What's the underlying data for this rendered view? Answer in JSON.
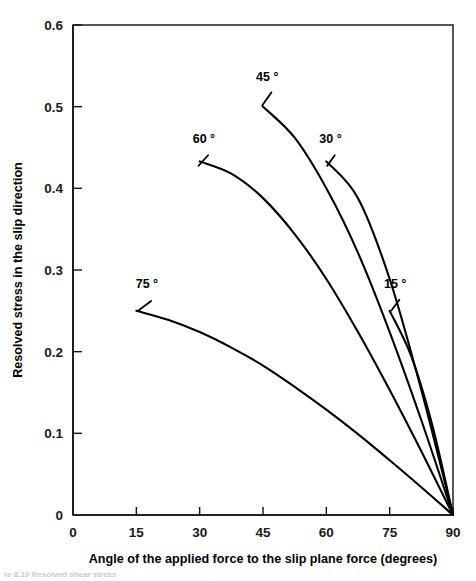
{
  "figure": {
    "name": "resolved-stress-vs-angle-plot",
    "caption_partial": "re 8.10  Resolved shear stress"
  },
  "chart_data": {
    "type": "line",
    "title": "",
    "xlabel": "Angle of the applied force to the slip plane force (degrees)",
    "ylabel": "Resolved stress in the slip direction",
    "xlim": [
      0,
      90
    ],
    "ylim": [
      0,
      0.6
    ],
    "xticks": [
      0,
      15,
      30,
      45,
      60,
      75,
      90
    ],
    "xticklabels": [
      "0",
      "15",
      "30",
      "45",
      "60",
      "75",
      "90"
    ],
    "yticks": [
      0,
      0.1,
      0.2,
      0.3,
      0.4,
      0.5,
      0.6
    ],
    "yticklabels": [
      "0",
      "0.1",
      "0.2",
      "0.3",
      "0.4",
      "0.5",
      "0.6"
    ],
    "grid": false,
    "legend": "inline-curve-labels",
    "series": [
      {
        "name": "75 °",
        "label": "75 °",
        "label_x": 17.5,
        "label_y": 0.278,
        "leader": [
          [
            18.5,
            0.262
          ],
          [
            15.5,
            0.2505
          ]
        ],
        "x": [
          15,
          22.5,
          30,
          37.5,
          45,
          52.5,
          60,
          67.5,
          75,
          82.5,
          90
        ],
        "y": [
          0.25,
          0.239,
          0.224,
          0.205,
          0.183,
          0.157,
          0.129,
          0.099,
          0.067,
          0.034,
          0.0
        ]
      },
      {
        "name": "60 °",
        "label": "60 °",
        "label_x": 31.0,
        "label_y": 0.455,
        "leader": [
          [
            32.0,
            0.4405
          ],
          [
            29.7,
            0.4275
          ]
        ],
        "x": [
          30,
          37.5,
          45,
          52.5,
          60,
          67.5,
          75,
          82.5,
          90
        ],
        "y": [
          0.433,
          0.418,
          0.388,
          0.344,
          0.289,
          0.224,
          0.153,
          0.078,
          0.0
        ]
      },
      {
        "name": "45 °",
        "label": "45 °",
        "label_x": 46.0,
        "label_y": 0.532,
        "leader": [
          [
            47.0,
            0.5175
          ],
          [
            44.8,
            0.5015
          ]
        ],
        "x": [
          45,
          52.5,
          60,
          67.5,
          75,
          82.5,
          90
        ],
        "y": [
          0.5,
          0.462,
          0.4,
          0.321,
          0.224,
          0.116,
          0.0
        ]
      },
      {
        "name": "30 °",
        "label": "30 °",
        "label_x": 61.0,
        "label_y": 0.455,
        "leader": [
          [
            62.0,
            0.4405
          ],
          [
            60.2,
            0.4275
          ]
        ],
        "x": [
          60,
          67.5,
          75,
          82.5,
          90
        ],
        "y": [
          0.433,
          0.388,
          0.289,
          0.153,
          0.0
        ]
      },
      {
        "name": "15 °",
        "label": "15 °",
        "label_x": 76.3,
        "label_y": 0.278,
        "leader": [
          [
            77.3,
            0.2635
          ],
          [
            75.4,
            0.2505
          ]
        ],
        "x": [
          75,
          80,
          85,
          90
        ],
        "y": [
          0.25,
          0.196,
          0.112,
          0.0
        ]
      }
    ]
  },
  "colors": {
    "curve": "#000000",
    "axis": "#111111",
    "background": "#ffffff"
  }
}
